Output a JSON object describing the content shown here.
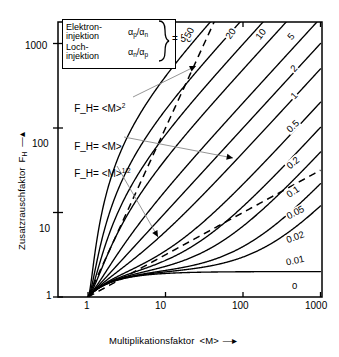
{
  "chart_data": {
    "type": "line",
    "title": "",
    "xlabel": "Multiplikationsfaktor <M>",
    "ylabel": "Zusatzrauschfaktor F_H",
    "xscale": "log",
    "yscale": "log",
    "xlim": [
      1,
      1000
    ],
    "ylim": [
      1,
      3000
    ],
    "xticks": [
      "1",
      "10",
      "100",
      "1000"
    ],
    "xtick_values": [
      1,
      10,
      100,
      1000
    ],
    "yticks": [
      "1",
      "10",
      "100",
      "1000"
    ],
    "ytick_values": [
      1,
      10,
      100,
      1000
    ],
    "grid": false,
    "legend_position": "top-left",
    "series_param_name": "k",
    "series": [
      {
        "name": "50",
        "k": 50,
        "label": "50"
      },
      {
        "name": "20",
        "k": 20,
        "label": "20"
      },
      {
        "name": "10",
        "k": 10,
        "label": "10"
      },
      {
        "name": "5",
        "k": 5,
        "label": "5"
      },
      {
        "name": "2",
        "k": 2,
        "label": "2"
      },
      {
        "name": "1",
        "k": 1,
        "label": "1"
      },
      {
        "name": "0.5",
        "k": 0.5,
        "label": "0.5"
      },
      {
        "name": "0.2",
        "k": 0.2,
        "label": "0.2"
      },
      {
        "name": "0.1",
        "k": 0.1,
        "label": "0.1"
      },
      {
        "name": "0.05",
        "k": 0.05,
        "label": "0.05"
      },
      {
        "name": "0.02",
        "k": 0.02,
        "label": "0.02"
      },
      {
        "name": "0.01",
        "k": 0.01,
        "label": "0.01"
      },
      {
        "name": "0",
        "k": 0,
        "label": "0"
      }
    ],
    "dashed_references": [
      {
        "name": "F_H = <M>^2",
        "exponent": 2
      },
      {
        "name": "F_H = <M>^1/2",
        "exponent": 0.5
      }
    ],
    "annotations": [
      {
        "id": "ann_m2",
        "text": "F",
        "sub": "H",
        "eq": "= <M>",
        "sup": "2"
      },
      {
        "id": "ann_m1",
        "text": "F",
        "sub": "H",
        "eq": "= <M>",
        "sup": ""
      },
      {
        "id": "ann_msqrt",
        "text": "F",
        "sub": "H",
        "eq": "= <M>",
        "sup": "1/2"
      }
    ]
  },
  "legend": {
    "row1_label_line1": "Elektron-",
    "row1_label_line2": "injektion",
    "row1_ratio_num": "α",
    "row1_ratio_num_sub": "p",
    "row1_ratio_den": "α",
    "row1_ratio_den_sub": "n",
    "row2_label_line1": "Loch-",
    "row2_label_line2": "injektion",
    "row2_ratio_num": "α",
    "row2_ratio_num_sub": "n",
    "row2_ratio_den": "α",
    "row2_ratio_den_sub": "p",
    "value": "= 50"
  },
  "axes": {
    "x_title": "Multiplikationsfaktor",
    "x_title_var": "<M>",
    "y_title": "Zusatzrauschfaktor",
    "y_title_var": "F",
    "y_title_var_sub": "H"
  },
  "curve_labels": [
    "50",
    "20",
    "10",
    "5",
    "2",
    "1",
    "0.5",
    "0.2",
    "0.1",
    "0.05",
    "0.02",
    "0.01",
    "0"
  ],
  "annotation_labels": {
    "m_squared": "F_H= <M>",
    "m_squared_sup": "2",
    "m_linear": "F_H= <M>",
    "m_sqrt": "F_H= <M>",
    "m_sqrt_sup": "1/2"
  },
  "colors": {
    "line": "#000000",
    "background": "#ffffff",
    "leader": "#8a8a8a"
  }
}
